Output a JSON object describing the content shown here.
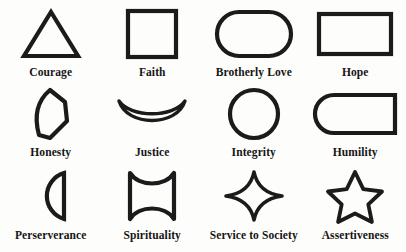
{
  "page": {
    "background_color": "#fdfdfb",
    "ink_color": "#1b1b1b"
  },
  "items": [
    {
      "label": "Courage",
      "icon": "triangle-shape",
      "row": 1,
      "col": 1
    },
    {
      "label": "Faith",
      "icon": "square-shape",
      "row": 1,
      "col": 2
    },
    {
      "label": "Brotherly Love",
      "icon": "stadium-pill-shape",
      "row": 1,
      "col": 3
    },
    {
      "label": "Hope",
      "icon": "rectangle-shape",
      "row": 1,
      "col": 4
    },
    {
      "label": "Honesty",
      "icon": "leaf-point-shape",
      "row": 2,
      "col": 1
    },
    {
      "label": "Justice",
      "icon": "crescent-bowl-shape",
      "row": 2,
      "col": 2
    },
    {
      "label": "Integrity",
      "icon": "circle-shape",
      "row": 2,
      "col": 3
    },
    {
      "label": "Humility",
      "icon": "half-rounded-rectangle-shape",
      "row": 2,
      "col": 4
    },
    {
      "label": "Perserverance",
      "icon": "half-circle-shape",
      "row": 3,
      "col": 1
    },
    {
      "label": "Spirituality",
      "icon": "concave-square-shape",
      "row": 3,
      "col": 2
    },
    {
      "label": "Service to Society",
      "icon": "four-point-star-shape",
      "row": 3,
      "col": 3
    },
    {
      "label": "Assertiveness",
      "icon": "five-point-star-shape",
      "row": 3,
      "col": 4
    }
  ]
}
